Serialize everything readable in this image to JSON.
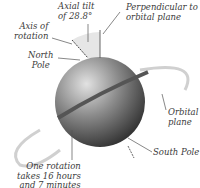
{
  "diagram": {
    "labels": {
      "axial_tilt_line1": "Axial tilt",
      "axial_tilt_line2": "of 28.8°",
      "perpendicular_line1": "Perpendicular to",
      "perpendicular_line2": "orbital plane",
      "axis_line1": "Axis of",
      "axis_line2": "rotation",
      "north_line1": "North",
      "north_line2": "Pole",
      "orbital_line1": "Orbital",
      "orbital_line2": "plane",
      "south_pole": "South Pole",
      "rotation_line1": "One rotation",
      "rotation_line2": "takes 16 hours",
      "rotation_line3": "and 7 minutes"
    },
    "colors": {
      "planet_light": "#d8d8d8",
      "planet_dark": "#2e2e2e",
      "tilt_wedge": "#e6e6e6",
      "text": "#3a3a3a"
    }
  }
}
